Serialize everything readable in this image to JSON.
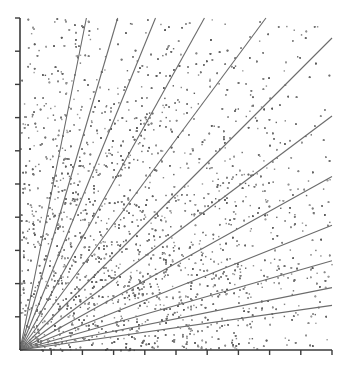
{
  "chart_data": {
    "type": "scatter",
    "title": "",
    "subtitle": "",
    "xlabel": "",
    "ylabel": "",
    "xlim": [
      0,
      120
    ],
    "ylim": [
      0,
      120
    ],
    "grid": false,
    "legend": null,
    "background_color": "#ffffff",
    "point_color": "#7a7a7a",
    "point_size": 1.4,
    "point_count": 6000,
    "axis_color": "#3a3a3a",
    "ray_color": "#6b6b6b",
    "ray_width": 1.1,
    "axes": {
      "origin_px": [
        20,
        350
      ],
      "x_axis": {
        "from_px": [
          20,
          350
        ],
        "to_px": [
          332,
          350
        ],
        "tick_count": 10,
        "tick_length_px": 5,
        "tick_direction": "down",
        "tick_labels": []
      },
      "y_axis": {
        "from_px": [
          20,
          350
        ],
        "to_px": [
          20,
          18
        ],
        "tick_count": 10,
        "tick_length_px": 5,
        "tick_direction": "left",
        "tick_labels": []
      }
    },
    "plot_area_px": {
      "left": 20,
      "top": 18,
      "right": 332,
      "bottom": 350
    },
    "rays": [
      {
        "slope": 0.143,
        "label": "1/7"
      },
      {
        "slope": 0.2,
        "label": "1/5"
      },
      {
        "slope": 0.286,
        "label": "2/7"
      },
      {
        "slope": 0.4,
        "label": "2/5"
      },
      {
        "slope": 0.556,
        "label": "5/9"
      },
      {
        "slope": 0.75,
        "label": "3/4"
      },
      {
        "slope": 1.0,
        "label": "1/1"
      },
      {
        "slope": 1.35,
        "label": "4/3"
      },
      {
        "slope": 1.8,
        "label": "9/5"
      },
      {
        "slope": 2.45,
        "label": "5/2"
      },
      {
        "slope": 3.4,
        "label": "7/2"
      },
      {
        "slope": 5.0,
        "label": "5/1"
      }
    ],
    "density": {
      "model": "radial-falloff",
      "note": "point probability decreases with distance from origin"
    }
  }
}
